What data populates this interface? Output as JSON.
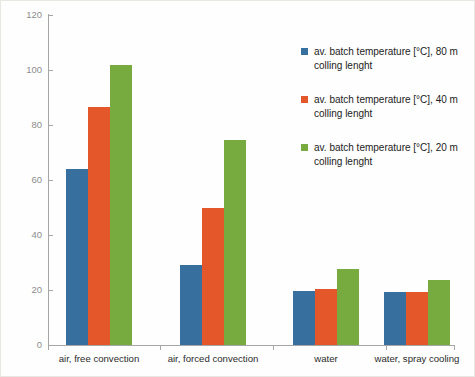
{
  "chart_data": {
    "type": "bar",
    "title": "",
    "xlabel": "",
    "ylabel": "batch temerature [ °C]",
    "ylim": [
      0,
      120
    ],
    "yticks": [
      0,
      20,
      40,
      60,
      80,
      100,
      120
    ],
    "ytick_labels": [
      "0",
      "20",
      "40",
      "60",
      "80",
      "100",
      "120"
    ],
    "grid": false,
    "legend_position": "right",
    "categories": [
      "air, free convection",
      "air, forced convection",
      "water",
      "water, spray cooling"
    ],
    "series": [
      {
        "name": "av. batch temperature [°C], 80 m colling lenght",
        "color": "#37709f",
        "values": [
          64.0,
          29.0,
          19.5,
          19.3
        ]
      },
      {
        "name": "av. batch temperature [°C], 40 m colling lenght",
        "color": "#e4572a",
        "values": [
          86.6,
          49.7,
          20.5,
          19.3
        ]
      },
      {
        "name": "av. batch temperature [°C], 20 m colling lenght",
        "color": "#78ab3f",
        "values": [
          101.8,
          74.6,
          27.5,
          23.5
        ]
      }
    ],
    "legend": [
      {
        "label": "av. batch temperature [°C], 80 m colling lenght",
        "color": "#37709f"
      },
      {
        "label": "av. batch temperature [°C], 40 m colling lenght",
        "color": "#e4572a"
      },
      {
        "label": "av. batch temperature [°C], 20 m colling lenght",
        "color": "#78ab3f"
      }
    ],
    "colors": {
      "axis": "#a6a6a6",
      "tick_text": "#8d8d8d",
      "label_text": "#1c1c1c",
      "background": "#ffffff"
    }
  }
}
